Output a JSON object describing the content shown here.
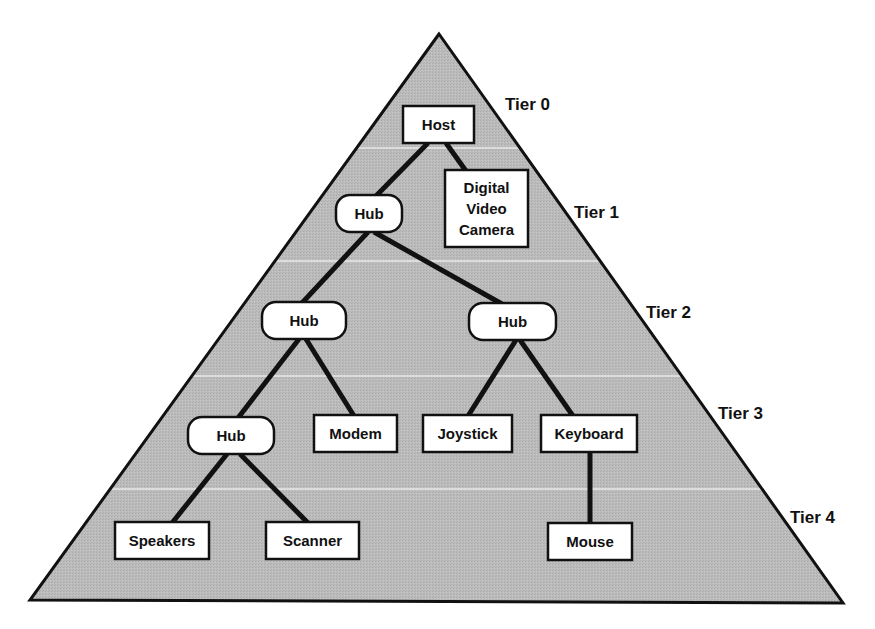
{
  "diagram": {
    "type": "usb-tiered-star-topology",
    "colors": {
      "pyramid_fill": "#b9b9b9",
      "pyramid_stroke": "#111111",
      "divider": "#dcdcdc",
      "node_fill": "#ffffff",
      "node_stroke": "#111111",
      "link": "#111111"
    },
    "tiers": [
      {
        "label": "Tier 0"
      },
      {
        "label": "Tier 1"
      },
      {
        "label": "Tier 2"
      },
      {
        "label": "Tier 3"
      },
      {
        "label": "Tier 4"
      }
    ],
    "nodes": {
      "host": {
        "label": "Host",
        "shape": "rect",
        "tier": 0
      },
      "hub1": {
        "label": "Hub",
        "shape": "rounded",
        "tier": 1
      },
      "camera": {
        "label_lines": [
          "Digital",
          "Video",
          "Camera"
        ],
        "shape": "rect",
        "tier": 1
      },
      "hub2_left": {
        "label": "Hub",
        "shape": "rounded",
        "tier": 2
      },
      "hub2_right": {
        "label": "Hub",
        "shape": "rounded",
        "tier": 2
      },
      "hub3": {
        "label": "Hub",
        "shape": "rounded",
        "tier": 3
      },
      "modem": {
        "label": "Modem",
        "shape": "rect",
        "tier": 3
      },
      "joystick": {
        "label": "Joystick",
        "shape": "rect",
        "tier": 3
      },
      "keyboard": {
        "label": "Keyboard",
        "shape": "rect",
        "tier": 3
      },
      "speakers": {
        "label": "Speakers",
        "shape": "rect",
        "tier": 4
      },
      "scanner": {
        "label": "Scanner",
        "shape": "rect",
        "tier": 4
      },
      "mouse": {
        "label": "Mouse",
        "shape": "rect",
        "tier": 4
      }
    },
    "edges": [
      [
        "host",
        "hub1"
      ],
      [
        "host",
        "camera"
      ],
      [
        "hub1",
        "hub2_left"
      ],
      [
        "hub1",
        "hub2_right"
      ],
      [
        "hub2_left",
        "hub3"
      ],
      [
        "hub2_left",
        "modem"
      ],
      [
        "hub2_right",
        "joystick"
      ],
      [
        "hub2_right",
        "keyboard"
      ],
      [
        "hub3",
        "speakers"
      ],
      [
        "hub3",
        "scanner"
      ],
      [
        "keyboard",
        "mouse"
      ]
    ]
  }
}
